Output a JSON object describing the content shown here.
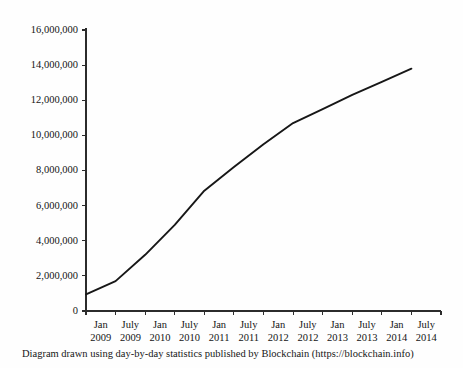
{
  "caption": "Diagram drawn using day-by-day statistics published by Blockchain (https://blockchain.info)",
  "chart_data": {
    "type": "line",
    "title": "",
    "subtitle": "",
    "xlabel": "",
    "ylabel": "",
    "grid": false,
    "legend": "none",
    "line_color": "#171717",
    "axis_color": "#2b2b2b",
    "categories": [
      "Jan 2009",
      "July 2009",
      "Jan 2010",
      "July 2010",
      "Jan 2011",
      "July 2011",
      "Jan 2012",
      "July 2012",
      "Jan 2013",
      "July 2013",
      "Jan 2014",
      "July 2014"
    ],
    "xtick_labels": [
      {
        "month": "Jan",
        "year": "2009"
      },
      {
        "month": "July",
        "year": "2009"
      },
      {
        "month": "Jan",
        "year": "2010"
      },
      {
        "month": "July",
        "year": "2010"
      },
      {
        "month": "Jan",
        "year": "2011"
      },
      {
        "month": "July",
        "year": "2011"
      },
      {
        "month": "Jan",
        "year": "2012"
      },
      {
        "month": "July",
        "year": "2012"
      },
      {
        "month": "Jan",
        "year": "2013"
      },
      {
        "month": "July",
        "year": "2013"
      },
      {
        "month": "Jan",
        "year": "2014"
      },
      {
        "month": "July",
        "year": "2014"
      }
    ],
    "values": [
      950000,
      1700000,
      3200000,
      4900000,
      6850000,
      8200000,
      9500000,
      10700000,
      11500000,
      12300000,
      13050000,
      13800000
    ],
    "ylim": [
      0,
      16000000
    ],
    "ytick_values": [
      0,
      2000000,
      4000000,
      6000000,
      8000000,
      10000000,
      12000000,
      14000000,
      16000000
    ],
    "ytick_labels": [
      "0",
      "2,000,000",
      "4,000,000",
      "6,000,000",
      "8,000,000",
      "10,000,000",
      "12,000,000",
      "14,000,000",
      "16,000,000"
    ]
  }
}
